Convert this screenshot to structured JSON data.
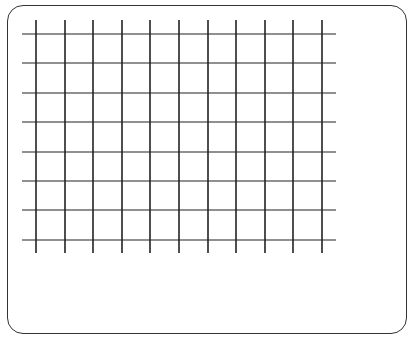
{
  "diagram": {
    "type": "grid",
    "grid": {
      "vertical_lines": 11,
      "horizontal_lines": 8,
      "vertical_x": [
        36,
        65,
        93,
        122,
        150,
        179,
        208,
        236,
        265,
        293,
        322
      ],
      "horizontal_y": [
        34,
        63,
        93,
        122,
        152,
        181,
        210,
        240
      ],
      "vertical_span": [
        20,
        253
      ],
      "horizontal_span": [
        22,
        336
      ]
    },
    "colors": {
      "line": "#222222",
      "frame": "#333333",
      "background": "#ffffff"
    }
  }
}
